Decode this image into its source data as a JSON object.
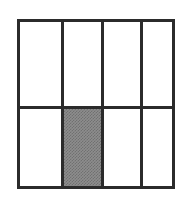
{
  "figure": {
    "name": "shaded-fraction-grid",
    "canvas": {
      "width": 191,
      "height": 197,
      "background_color": "#ffffff"
    },
    "frame": {
      "x": 17,
      "y": 19,
      "width": 158,
      "height": 170,
      "stroke_color": "#2b2b2b",
      "stroke_width": 3,
      "fill_color": "#ffffff"
    },
    "grid": {
      "columns": 4,
      "rows": 2,
      "total_cells": 8,
      "shaded_cells": 1,
      "unshaded_cells": 7,
      "shaded_fraction": "1/8",
      "column_divider_x": [
        41,
        81,
        120
      ],
      "row_divider_y": [
        84
      ],
      "line_color": "#2b2b2b",
      "line_width": 3,
      "shade_color": "#8d8d8d",
      "empty_color": "#ffffff"
    },
    "cells": [
      {
        "id": "cell-r1-c1",
        "row": 1,
        "column": 1,
        "state": "empty",
        "x": 0,
        "y": 0,
        "width": 41,
        "height": 84
      },
      {
        "id": "cell-r1-c2",
        "row": 1,
        "column": 2,
        "state": "empty",
        "x": 44,
        "y": 0,
        "width": 37,
        "height": 84
      },
      {
        "id": "cell-r1-c3",
        "row": 1,
        "column": 3,
        "state": "empty",
        "x": 84,
        "y": 0,
        "width": 36,
        "height": 84
      },
      {
        "id": "cell-r1-c4",
        "row": 1,
        "column": 4,
        "state": "empty",
        "x": 123,
        "y": 0,
        "width": 29,
        "height": 84
      },
      {
        "id": "cell-r2-c1",
        "row": 2,
        "column": 1,
        "state": "empty",
        "x": 0,
        "y": 87,
        "width": 41,
        "height": 77
      },
      {
        "id": "cell-r2-c2",
        "row": 2,
        "column": 2,
        "state": "shaded",
        "x": 44,
        "y": 87,
        "width": 37,
        "height": 77
      },
      {
        "id": "cell-r2-c3",
        "row": 2,
        "column": 3,
        "state": "empty",
        "x": 84,
        "y": 87,
        "width": 36,
        "height": 77
      },
      {
        "id": "cell-r2-c4",
        "row": 2,
        "column": 4,
        "state": "empty",
        "x": 123,
        "y": 87,
        "width": 29,
        "height": 77
      }
    ],
    "dividers": {
      "vertical": [
        {
          "id": "column-divider-1",
          "x": 41
        },
        {
          "id": "column-divider-2",
          "x": 81
        },
        {
          "id": "column-divider-3",
          "x": 120
        }
      ],
      "horizontal": [
        {
          "id": "row-divider-1",
          "y": 84
        }
      ]
    }
  }
}
